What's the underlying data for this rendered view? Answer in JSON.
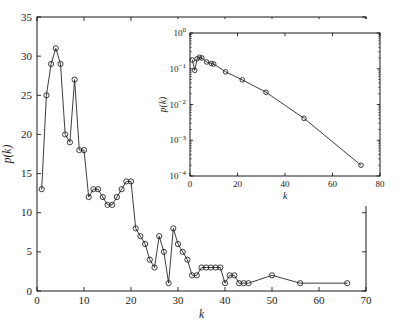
{
  "figure": {
    "background_color": "#ffffff",
    "line_color": "#1a1a1a",
    "marker": "open-circle"
  },
  "chart_data": [
    {
      "id": "main",
      "type": "line",
      "title": "",
      "xlabel": "k",
      "ylabel": "p(k)",
      "xlim": [
        0,
        70
      ],
      "ylim": [
        0,
        35
      ],
      "xticks": [
        0,
        10,
        20,
        30,
        40,
        50,
        60,
        70
      ],
      "yticks": [
        0,
        5,
        10,
        15,
        20,
        25,
        30,
        35
      ],
      "xscale": "linear",
      "yscale": "linear",
      "grid": false,
      "legend": false,
      "marker": "open-circle",
      "x": [
        1,
        2,
        3,
        4,
        5,
        6,
        7,
        8,
        9,
        10,
        11,
        12,
        13,
        14,
        15,
        16,
        17,
        18,
        19,
        20,
        21,
        22,
        23,
        24,
        25,
        26,
        27,
        28,
        29,
        30,
        31,
        32,
        33,
        34,
        35,
        36,
        37,
        38,
        39,
        40,
        41,
        42,
        43,
        44,
        45,
        50,
        56,
        66
      ],
      "y": [
        13,
        25,
        29,
        31,
        29,
        20,
        19,
        27,
        18,
        18,
        12,
        13,
        13,
        12,
        11,
        11,
        12,
        13,
        14,
        14,
        8,
        7,
        6,
        4,
        3,
        7,
        5,
        1,
        8,
        6,
        5,
        4,
        2,
        2,
        3,
        3,
        3,
        3,
        3,
        1,
        2,
        2,
        1,
        1,
        1,
        2,
        1,
        1
      ]
    },
    {
      "id": "inset",
      "type": "line",
      "title": "",
      "xlabel": "k",
      "ylabel": "p(k)",
      "xlim": [
        0,
        80
      ],
      "ylim": [
        0.0001,
        1
      ],
      "xticks": [
        0,
        20,
        40,
        60,
        80
      ],
      "yticks": [
        0.0001,
        0.001,
        0.01,
        0.1,
        1
      ],
      "ytick_labels": [
        "10^-4",
        "10^-3",
        "10^-2",
        "10^-1",
        "10^0"
      ],
      "xscale": "linear",
      "yscale": "log",
      "grid": false,
      "legend": false,
      "marker": "open-circle",
      "x": [
        1,
        2,
        3,
        4,
        5,
        7,
        9,
        10,
        15,
        22,
        32,
        48,
        72
      ],
      "y": [
        0.175,
        0.09,
        0.19,
        0.21,
        0.2,
        0.155,
        0.14,
        0.135,
        0.082,
        0.049,
        0.022,
        0.0041,
        0.0002
      ]
    }
  ],
  "caption": {
    "text": ""
  }
}
